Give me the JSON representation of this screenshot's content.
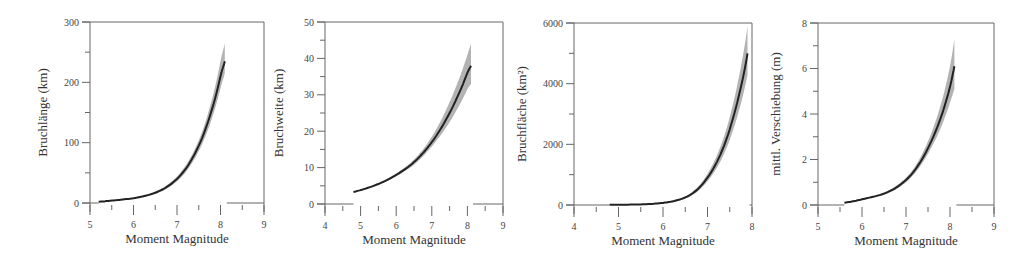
{
  "chart_data": [
    {
      "type": "line",
      "title": "",
      "xlabel": "Moment Magnitude",
      "ylabel": "Bruchlänge (km)",
      "xlim": [
        5,
        9
      ],
      "ylim": [
        0,
        300
      ],
      "xticks": [
        5,
        6,
        7,
        8,
        9
      ],
      "yticks": [
        0,
        100,
        200,
        300
      ],
      "grid": false,
      "series": [
        {
          "name": "median",
          "x": [
            5.2,
            5.5,
            6.0,
            6.5,
            7.0,
            7.5,
            8.0,
            8.1
          ],
          "values": [
            2,
            4,
            8,
            17,
            40,
            95,
            210,
            235
          ]
        },
        {
          "name": "upper",
          "x": [
            5.2,
            5.5,
            6.0,
            6.5,
            7.0,
            7.5,
            8.0,
            8.1
          ],
          "values": [
            2.2,
            4.4,
            9,
            19,
            44,
            104,
            235,
            265
          ]
        },
        {
          "name": "lower",
          "x": [
            5.2,
            5.5,
            6.0,
            6.5,
            7.0,
            7.5,
            8.0,
            8.1
          ],
          "values": [
            1.8,
            3.6,
            7,
            15,
            36,
            86,
            190,
            215
          ]
        }
      ]
    },
    {
      "type": "line",
      "title": "",
      "xlabel": "Moment Magnitude",
      "ylabel": "Bruchweite (km)",
      "xlim": [
        4,
        9
      ],
      "ylim": [
        0,
        50
      ],
      "xticks": [
        4,
        5,
        6,
        7,
        8,
        9
      ],
      "yticks": [
        0,
        10,
        20,
        30,
        40,
        50
      ],
      "grid": false,
      "series": [
        {
          "name": "median",
          "x": [
            4.8,
            5.5,
            6.0,
            6.5,
            7.0,
            7.5,
            8.0,
            8.1
          ],
          "values": [
            3.3,
            5.5,
            8,
            11.5,
            17,
            25,
            36,
            38
          ]
        },
        {
          "name": "upper",
          "x": [
            4.8,
            5.5,
            6.0,
            6.5,
            7.0,
            7.5,
            8.0,
            8.1
          ],
          "values": [
            3.4,
            5.7,
            8.4,
            12.2,
            18.5,
            28,
            41,
            44
          ]
        },
        {
          "name": "lower",
          "x": [
            4.8,
            5.5,
            6.0,
            6.5,
            7.0,
            7.5,
            8.0,
            8.1
          ],
          "values": [
            3.2,
            5.3,
            7.6,
            10.8,
            15.8,
            22.5,
            31.5,
            33
          ]
        }
      ]
    },
    {
      "type": "line",
      "title": "",
      "xlabel": "Moment Magnitude",
      "ylabel": "Bruchfläche (km²)",
      "xlim": [
        4,
        8
      ],
      "ylim": [
        0,
        6000
      ],
      "xticks": [
        4,
        5,
        6,
        7,
        8
      ],
      "yticks": [
        0,
        2000,
        4000,
        6000
      ],
      "grid": false,
      "series": [
        {
          "name": "median",
          "x": [
            4.8,
            5.5,
            6.0,
            6.5,
            7.0,
            7.5,
            7.9
          ],
          "values": [
            5,
            20,
            70,
            250,
            900,
            2500,
            5000
          ]
        },
        {
          "name": "upper",
          "x": [
            4.8,
            5.5,
            6.0,
            6.5,
            7.0,
            7.5,
            7.9
          ],
          "values": [
            6,
            23,
            80,
            285,
            1030,
            2900,
            5900
          ]
        },
        {
          "name": "lower",
          "x": [
            4.8,
            5.5,
            6.0,
            6.5,
            7.0,
            7.5,
            7.9
          ],
          "values": [
            4,
            17,
            60,
            215,
            780,
            2150,
            4300
          ]
        }
      ]
    },
    {
      "type": "line",
      "title": "",
      "xlabel": "Moment Magnitude",
      "ylabel": "mittl. Verschiebung (m)",
      "xlim": [
        5,
        9
      ],
      "ylim": [
        0,
        8
      ],
      "xticks": [
        5,
        6,
        7,
        8,
        9
      ],
      "yticks": [
        0,
        2,
        4,
        6,
        8
      ],
      "grid": false,
      "series": [
        {
          "name": "median",
          "x": [
            5.6,
            6.0,
            6.5,
            7.0,
            7.5,
            8.0,
            8.1
          ],
          "values": [
            0.1,
            0.25,
            0.5,
            1.1,
            2.5,
            5.2,
            6.1
          ]
        },
        {
          "name": "upper",
          "x": [
            5.6,
            6.0,
            6.5,
            7.0,
            7.5,
            8.0,
            8.1
          ],
          "values": [
            0.11,
            0.27,
            0.55,
            1.2,
            2.8,
            6.1,
            7.3
          ]
        },
        {
          "name": "lower",
          "x": [
            5.6,
            6.0,
            6.5,
            7.0,
            7.5,
            8.0,
            8.1
          ],
          "values": [
            0.09,
            0.23,
            0.45,
            1.0,
            2.25,
            4.5,
            5.1
          ]
        }
      ]
    }
  ],
  "layout": [
    {
      "left": 90,
      "right": 264,
      "top": 22,
      "bottom": 203,
      "ylabel_x": 47
    },
    {
      "left": 325,
      "right": 503,
      "top": 22,
      "bottom": 204,
      "ylabel_x": 283
    },
    {
      "left": 574,
      "right": 752,
      "top": 23,
      "bottom": 205,
      "ylabel_x": 526
    },
    {
      "left": 818,
      "right": 994,
      "top": 23,
      "bottom": 205,
      "ylabel_x": 780
    }
  ],
  "colors": {
    "axis": "#666666",
    "line": "#222222",
    "band": "#9a9a9a"
  }
}
